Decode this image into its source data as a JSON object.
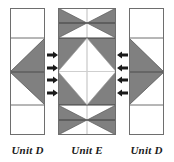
{
  "figure": {
    "type": "quilt-block-unit-assembly-diagram",
    "background_color": "#ffffff",
    "shade_color": "#808080",
    "outline_color": "#4d4d4d",
    "arrow_color": "#1a1a1a",
    "white_color": "#ffffff"
  },
  "units": [
    {
      "id": "unit-d-left",
      "label": "Unit D",
      "x": 10,
      "y": 8,
      "width": 35,
      "height": 127,
      "rows": 3,
      "row_divider_y": [
        38,
        105
      ],
      "shape": "flying-geese-left",
      "shaded_triangle_direction": "left"
    },
    {
      "id": "unit-e-middle",
      "label": "Unit E",
      "x": 58,
      "y": 8,
      "width": 58,
      "height": 127,
      "rows": 3,
      "row_divider_y": [
        38,
        105
      ],
      "shape": "hourglass-diamond-hourglass",
      "center_shape": "white-diamond-on-shaded-ground"
    },
    {
      "id": "unit-d-right",
      "label": "Unit D",
      "x": 129,
      "y": 8,
      "width": 35,
      "height": 127,
      "rows": 3,
      "row_divider_y": [
        38,
        105
      ],
      "shape": "flying-geese-right",
      "shaded_triangle_direction": "right"
    }
  ],
  "arrow_groups": [
    {
      "id": "arrows-left",
      "direction": "right",
      "count": 4,
      "x": 47,
      "y_positions": [
        55,
        67,
        79,
        91
      ]
    },
    {
      "id": "arrows-right",
      "direction": "left",
      "count": 4,
      "x": 117,
      "y_positions": [
        55,
        67,
        79,
        91
      ]
    }
  ],
  "labels": {
    "left": "Unit D",
    "middle": "Unit E",
    "right": "Unit D"
  }
}
